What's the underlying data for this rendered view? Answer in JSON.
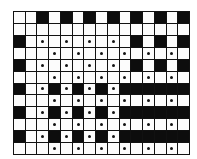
{
  "diagram": {
    "type": "weave-draft-grid",
    "columns": 15,
    "rows": 12,
    "legend": {
      "B": "filled black cell",
      "W": "empty white cell",
      "D": "white cell with dot"
    },
    "cells": [
      [
        "W",
        "W",
        "B",
        "W",
        "B",
        "W",
        "B",
        "W",
        "B",
        "W",
        "B",
        "W",
        "B",
        "W",
        "B"
      ],
      [
        "W",
        "W",
        "W",
        "W",
        "W",
        "W",
        "W",
        "W",
        "W",
        "W",
        "W",
        "W",
        "W",
        "W",
        "W"
      ],
      [
        "B",
        "W",
        "D",
        "W",
        "D",
        "W",
        "D",
        "W",
        "D",
        "W",
        "B",
        "W",
        "B",
        "W",
        "B"
      ],
      [
        "W",
        "W",
        "W",
        "D",
        "W",
        "D",
        "W",
        "D",
        "W",
        "D",
        "W",
        "D",
        "W",
        "D",
        "W"
      ],
      [
        "B",
        "W",
        "D",
        "W",
        "D",
        "W",
        "D",
        "W",
        "D",
        "W",
        "B",
        "W",
        "B",
        "W",
        "B"
      ],
      [
        "W",
        "W",
        "W",
        "D",
        "W",
        "D",
        "W",
        "D",
        "W",
        "D",
        "W",
        "D",
        "W",
        "D",
        "W"
      ],
      [
        "B",
        "W",
        "D",
        "B",
        "D",
        "B",
        "D",
        "B",
        "D",
        "B",
        "B",
        "B",
        "B",
        "B",
        "B"
      ],
      [
        "W",
        "W",
        "W",
        "D",
        "W",
        "D",
        "W",
        "D",
        "W",
        "D",
        "W",
        "D",
        "W",
        "D",
        "W"
      ],
      [
        "B",
        "W",
        "D",
        "B",
        "D",
        "B",
        "D",
        "B",
        "D",
        "B",
        "B",
        "B",
        "B",
        "B",
        "B"
      ],
      [
        "W",
        "W",
        "W",
        "D",
        "W",
        "D",
        "W",
        "D",
        "W",
        "D",
        "W",
        "D",
        "W",
        "D",
        "W"
      ],
      [
        "B",
        "W",
        "D",
        "B",
        "D",
        "B",
        "D",
        "B",
        "D",
        "B",
        "B",
        "B",
        "B",
        "B",
        "B"
      ],
      [
        "W",
        "W",
        "W",
        "D",
        "W",
        "D",
        "W",
        "D",
        "W",
        "D",
        "W",
        "D",
        "W",
        "D",
        "W"
      ]
    ],
    "colors": {
      "black": "#0d0d0d",
      "white": "#fcfcfc",
      "line": "#111111"
    }
  }
}
